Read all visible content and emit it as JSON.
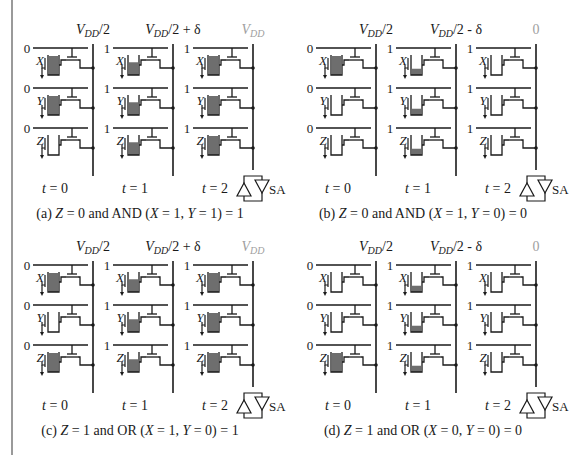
{
  "colors": {
    "line": "#1a1a1a",
    "fill": "#6e6e6e",
    "muted": "#a0a0a0",
    "rule": "#9a9a9a"
  },
  "panels": [
    {
      "id": "a",
      "caption": "(a) Z = 0 and AND (X = 1, Y = 1) = 1",
      "caption_parts": {
        "pre": "(a) ",
        "z": "Z",
        "mid1": " = 0 and AND (",
        "x": "X",
        "mid2": " = 1, ",
        "y": "Y",
        "post": " = 1) = 1"
      },
      "bitline_labels": [
        {
          "base": "V",
          "sub": "DD",
          "rest": "/2",
          "muted": false
        },
        {
          "base": "V",
          "sub": "DD",
          "rest": "/2 + δ",
          "muted": false
        },
        {
          "base": "V",
          "sub": "DD",
          "rest": "",
          "muted": true
        }
      ],
      "times": [
        "t = 0",
        "t = 1",
        "t = 2"
      ],
      "columns": [
        {
          "wordline": "0",
          "cells": [
            {
              "name": "X",
              "fill": 1.0
            },
            {
              "name": "Y",
              "fill": 1.0
            },
            {
              "name": "Z",
              "fill": 0
            }
          ]
        },
        {
          "wordline": "1",
          "cells": [
            {
              "name": "X",
              "fill": 0.67
            },
            {
              "name": "Y",
              "fill": 0.67
            },
            {
              "name": "Z",
              "fill": 0.67
            }
          ]
        },
        {
          "wordline": "1",
          "cells": [
            {
              "name": "X",
              "fill": 1.0
            },
            {
              "name": "Y",
              "fill": 1.0
            },
            {
              "name": "Z",
              "fill": 1.0
            }
          ]
        }
      ],
      "sense_amp": "SA"
    },
    {
      "id": "b",
      "caption": "(b) Z = 0 and AND (X = 1, Y = 0) = 0",
      "caption_parts": {
        "pre": "(b) ",
        "z": "Z",
        "mid1": " = 0 and AND (",
        "x": "X",
        "mid2": " = 1, ",
        "y": "Y",
        "post": " = 0) = 0"
      },
      "bitline_labels": [
        {
          "base": "V",
          "sub": "DD",
          "rest": "/2",
          "muted": false
        },
        {
          "base": "V",
          "sub": "DD",
          "rest": "/2 - δ",
          "muted": false
        },
        {
          "base": "",
          "sub": "",
          "rest": "0",
          "muted": true
        }
      ],
      "times": [
        "t = 0",
        "t = 1",
        "t = 2"
      ],
      "columns": [
        {
          "wordline": "0",
          "cells": [
            {
              "name": "X",
              "fill": 1.0
            },
            {
              "name": "Y",
              "fill": 0
            },
            {
              "name": "Z",
              "fill": 0
            }
          ]
        },
        {
          "wordline": "1",
          "cells": [
            {
              "name": "X",
              "fill": 0.33
            },
            {
              "name": "Y",
              "fill": 0.33
            },
            {
              "name": "Z",
              "fill": 0.33
            }
          ]
        },
        {
          "wordline": "1",
          "cells": [
            {
              "name": "X",
              "fill": 0
            },
            {
              "name": "Y",
              "fill": 0
            },
            {
              "name": "Z",
              "fill": 0
            }
          ]
        }
      ],
      "sense_amp": "SA"
    },
    {
      "id": "c",
      "caption": "(c) Z = 1 and OR (X = 1, Y = 0) = 1",
      "caption_parts": {
        "pre": "(c) ",
        "z": "Z",
        "mid1": " = 1 and OR (",
        "x": "X",
        "mid2": " = 1, ",
        "y": "Y",
        "post": " = 0) = 1"
      },
      "bitline_labels": [
        {
          "base": "V",
          "sub": "DD",
          "rest": "/2",
          "muted": false
        },
        {
          "base": "V",
          "sub": "DD",
          "rest": "/2 + δ",
          "muted": false
        },
        {
          "base": "V",
          "sub": "DD",
          "rest": "",
          "muted": true
        }
      ],
      "times": [
        "t = 0",
        "t = 1",
        "t = 2"
      ],
      "columns": [
        {
          "wordline": "0",
          "cells": [
            {
              "name": "X",
              "fill": 1.0
            },
            {
              "name": "Y",
              "fill": 0
            },
            {
              "name": "Z",
              "fill": 1.0
            }
          ]
        },
        {
          "wordline": "1",
          "cells": [
            {
              "name": "X",
              "fill": 0.67
            },
            {
              "name": "Y",
              "fill": 0.67
            },
            {
              "name": "Z",
              "fill": 0.67
            }
          ]
        },
        {
          "wordline": "1",
          "cells": [
            {
              "name": "X",
              "fill": 1.0
            },
            {
              "name": "Y",
              "fill": 1.0
            },
            {
              "name": "Z",
              "fill": 1.0
            }
          ]
        }
      ],
      "sense_amp": "SA"
    },
    {
      "id": "d",
      "caption": "(d) Z = 1 and OR (X = 0, Y = 0) = 0",
      "caption_parts": {
        "pre": "(d) ",
        "z": "Z",
        "mid1": " = 1 and OR (",
        "x": "X",
        "mid2": " = 0, ",
        "y": "Y",
        "post": " = 0) = 0"
      },
      "bitline_labels": [
        {
          "base": "V",
          "sub": "DD",
          "rest": "/2",
          "muted": false
        },
        {
          "base": "V",
          "sub": "DD",
          "rest": "/2 - δ",
          "muted": false
        },
        {
          "base": "",
          "sub": "",
          "rest": "0",
          "muted": true
        }
      ],
      "times": [
        "t = 0",
        "t = 1",
        "t = 2"
      ],
      "columns": [
        {
          "wordline": "0",
          "cells": [
            {
              "name": "X",
              "fill": 0
            },
            {
              "name": "Y",
              "fill": 0
            },
            {
              "name": "Z",
              "fill": 1.0
            }
          ]
        },
        {
          "wordline": "1",
          "cells": [
            {
              "name": "X",
              "fill": 0.33
            },
            {
              "name": "Y",
              "fill": 0.33
            },
            {
              "name": "Z",
              "fill": 0.33
            }
          ]
        },
        {
          "wordline": "1",
          "cells": [
            {
              "name": "X",
              "fill": 0
            },
            {
              "name": "Y",
              "fill": 0
            },
            {
              "name": "Z",
              "fill": 0
            }
          ]
        }
      ],
      "sense_amp": "SA"
    }
  ]
}
